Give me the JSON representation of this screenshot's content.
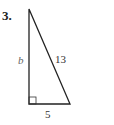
{
  "problem": {
    "number": "3.",
    "figure": "right-triangle",
    "labels": {
      "vertical_leg": "b",
      "hypotenuse": "13",
      "base": "5"
    }
  }
}
